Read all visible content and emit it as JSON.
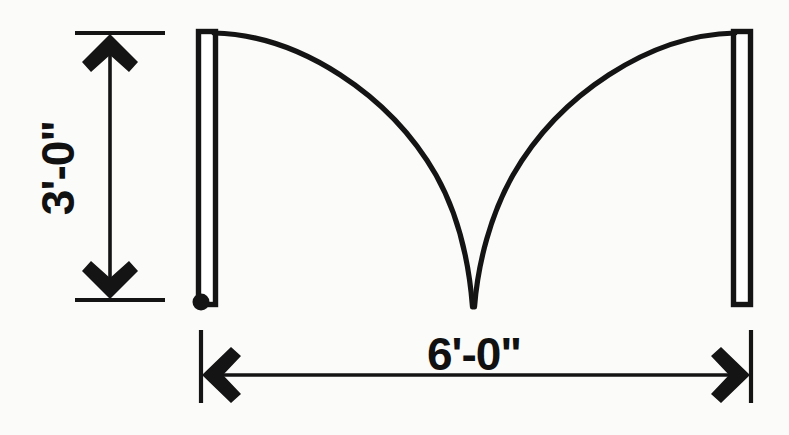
{
  "drawing": {
    "title": "Double door swing plan detail",
    "background_color": "#fbfbfa",
    "line_color": "#141414"
  },
  "dimensions": {
    "vertical": {
      "label": "3'-0\"",
      "name": "door-depth-dimension",
      "orientation": "vertical",
      "rotation_deg": -90,
      "arrow_top_y": 35,
      "arrow_bottom_y": 298,
      "dimension_line_x": 110,
      "extension_line_left_x": 75,
      "extension_line_right_x": 165,
      "text_x": 62,
      "text_y": 168
    },
    "horizontal": {
      "label": "6'-0\"",
      "name": "door-opening-width-dimension",
      "orientation": "horizontal",
      "rotation_deg": 0,
      "arrow_left_x": 200,
      "arrow_right_x": 751,
      "dimension_line_y": 375,
      "extension_line_top_y": 330,
      "extension_line_bottom_y": 403,
      "text_x": 474,
      "text_y": 360
    }
  },
  "door_panels": [
    {
      "name": "left-door-leaf",
      "x": 198.5,
      "y": 31.5,
      "width": 17,
      "height": 273,
      "has_hinge_marker": true
    },
    {
      "name": "right-door-leaf",
      "x": 733.5,
      "y": 31.5,
      "width": 17,
      "height": 273,
      "has_hinge_marker": false
    }
  ],
  "hinge_marker": {
    "name": "hinge-pivot-point",
    "cx": 201,
    "cy": 302,
    "r": 8.5
  },
  "swing_arcs": [
    {
      "name": "left-door-swing-arc",
      "start_x": 215,
      "start_y": 34,
      "end_x": 472,
      "end_y": 306,
      "control_x": 420,
      "control_y": 60,
      "direction": "clockwise"
    },
    {
      "name": "right-door-swing-arc",
      "start_x": 735,
      "start_y": 34,
      "end_x": 474,
      "end_y": 306,
      "control_x": 528,
      "control_y": 60,
      "direction": "counter-clockwise"
    }
  ]
}
